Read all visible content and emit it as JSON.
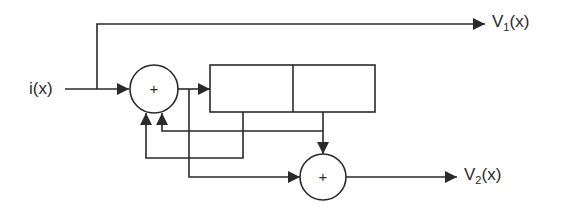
{
  "diagram": {
    "input_label": "i(x)",
    "output1": {
      "base": "V",
      "sub": "1",
      "arg": "(x)"
    },
    "output2": {
      "base": "V",
      "sub": "2",
      "arg": "(x)"
    },
    "adder1_symbol": "+",
    "adder2_symbol": "+",
    "register_cells": [
      "",
      ""
    ],
    "line_color": "#2a2a2a"
  }
}
